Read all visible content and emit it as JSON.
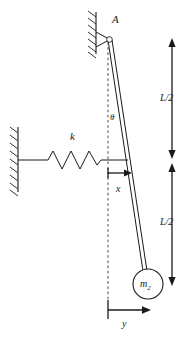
{
  "figure": {
    "type": "physics-schematic",
    "width": 195,
    "height": 343,
    "background_color": "#ffffff",
    "ink_color": "#1a1a1a"
  },
  "labels": {
    "pivot": "A",
    "angle": "θ",
    "spring_constant": "k",
    "horizontal_displacement": "x",
    "bob_displacement": "y",
    "length_upper": "L/2",
    "length_lower": "L/2",
    "bob_mass": "m",
    "bob_mass_subscript": "2"
  },
  "elements": {
    "ceiling_support": {
      "name": "ceiling-hatched-support",
      "wall_x": 96,
      "wall_y_top": 12,
      "wall_y_bottom": 54,
      "hatch_count": 6,
      "hatch_side": "left"
    },
    "left_wall_support": {
      "name": "left-hatched-wall",
      "wall_x": 18,
      "wall_y_top": 127,
      "wall_y_bottom": 192,
      "hatch_count": 8,
      "hatch_side": "left"
    },
    "pivot_point": {
      "name": "pivot-joint",
      "cx": 109,
      "cy": 39,
      "r": 2.6
    },
    "rod": {
      "name": "pendulum-rod",
      "top_x": 109,
      "top_y": 39,
      "bottom_x": 146,
      "bottom_y": 270,
      "thickness": 3
    },
    "bob": {
      "name": "pendulum-bob",
      "cx": 148,
      "cy": 284,
      "r": 15
    },
    "vertical_reference": {
      "name": "vertical-dashed-reference",
      "x": 108,
      "y_top": 40,
      "y_bottom": 300,
      "style": "dashed"
    },
    "spring": {
      "name": "coil-spring",
      "attach_wall_x": 18,
      "attach_rod_x": 128,
      "y": 160,
      "zigzag_start_x": 48,
      "zigzag_end_x": 100,
      "peaks": 3,
      "amplitude": 10
    },
    "x_arrow": {
      "name": "x-displacement-arrow",
      "from_x": 108,
      "to_x": 131,
      "y": 173,
      "direction": "right"
    },
    "y_arrow": {
      "name": "y-displacement-arrow",
      "from_x": 108,
      "to_x": 150,
      "y": 310,
      "direction": "right"
    },
    "length_arrow_upper": {
      "name": "length-upper-dimension-arrow",
      "x": 172,
      "y_top": 40,
      "y_bottom": 158,
      "direction": "double"
    },
    "length_arrow_lower": {
      "name": "length-lower-dimension-arrow",
      "x": 172,
      "y_top": 163,
      "y_bottom": 285,
      "direction": "double"
    }
  }
}
